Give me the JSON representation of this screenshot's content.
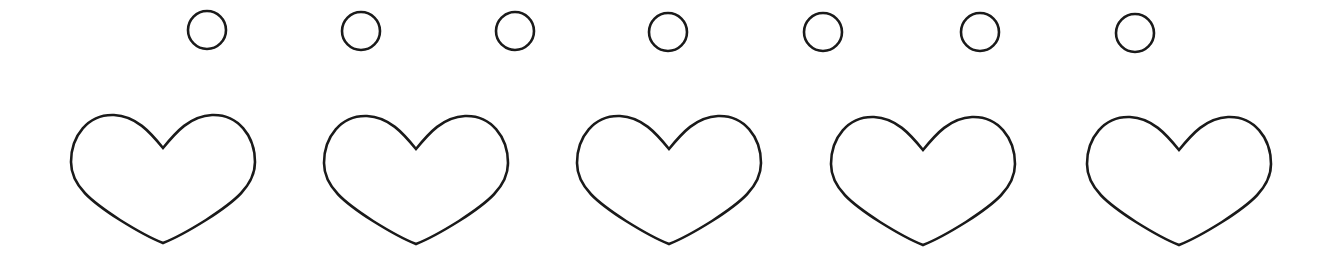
{
  "canvas": {
    "width": 1331,
    "height": 261,
    "background": "#ffffff"
  },
  "stroke_color": "#1a1a1a",
  "circles": [
    {
      "name": "circle-1",
      "cx": 207,
      "cy": 30,
      "r": 19
    },
    {
      "name": "circle-2",
      "cx": 361,
      "cy": 31,
      "r": 19
    },
    {
      "name": "circle-3",
      "cx": 515,
      "cy": 31,
      "r": 19
    },
    {
      "name": "circle-4",
      "cx": 668,
      "cy": 32,
      "r": 19
    },
    {
      "name": "circle-5",
      "cx": 823,
      "cy": 32,
      "r": 19
    },
    {
      "name": "circle-6",
      "cx": 980,
      "cy": 32,
      "r": 19
    },
    {
      "name": "circle-7",
      "cx": 1135,
      "cy": 33,
      "r": 19
    }
  ],
  "hearts": [
    {
      "name": "heart-1",
      "x": 70,
      "y": 112
    },
    {
      "name": "heart-2",
      "x": 323,
      "y": 113
    },
    {
      "name": "heart-3",
      "x": 576,
      "y": 113
    },
    {
      "name": "heart-4",
      "x": 830,
      "y": 114
    },
    {
      "name": "heart-5",
      "x": 1086,
      "y": 114
    }
  ]
}
